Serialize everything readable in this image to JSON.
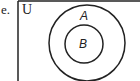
{
  "problem_label": "e.",
  "diagram": {
    "type": "venn",
    "universal_set": {
      "label": "U"
    },
    "sets": [
      {
        "label": "A",
        "contains": [
          "B"
        ]
      },
      {
        "label": "B",
        "subset_of": "A"
      }
    ],
    "stroke_color": "#222222",
    "background": "#ffffff"
  }
}
